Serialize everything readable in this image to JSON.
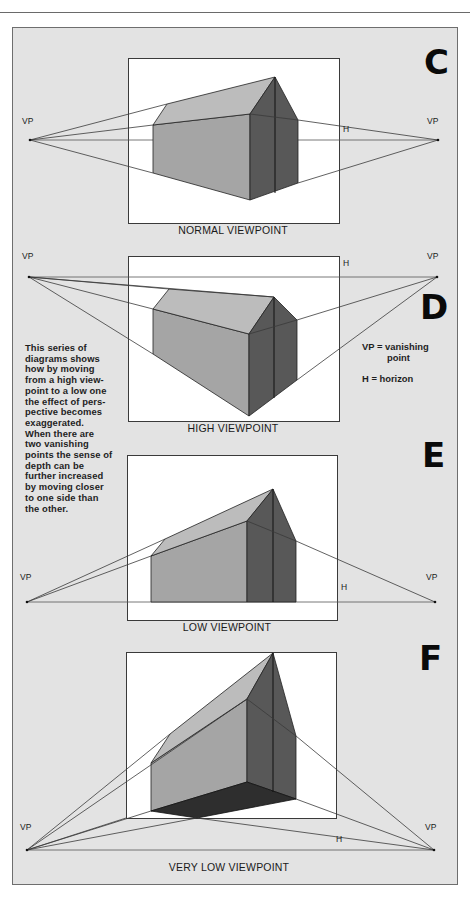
{
  "colors": {
    "panel_bg": "#e3e3e3",
    "panel_border": "#6e6e6e",
    "box_bg": "#ffffff",
    "roof": "#bcbcbc",
    "side_wall": "#a5a5a5",
    "gable": "#585858",
    "gable_right": "#666666",
    "underside": "#2e2e2e",
    "line": "#3a3a3a"
  },
  "description": {
    "lines": [
      "This series of",
      "diagrams shows",
      "how by moving",
      "from a high view-",
      "point to a low one",
      "the effect of pers-",
      "pective becomes",
      "exaggerated.",
      "When there are",
      "two vanishing",
      "points the sense of",
      "depth can be",
      "further increased",
      "by moving closer",
      "to one side than",
      "the other."
    ]
  },
  "legend": {
    "vp_line1": "VP = vanishing",
    "vp_line2": "point",
    "h_line": "H = horizon"
  },
  "diagrams": [
    {
      "letter": "C",
      "caption": "NORMAL VIEWPOINT",
      "vp_label": "VP",
      "h_label": "H",
      "box": [
        128,
        58,
        211,
        165
      ],
      "letter_pos": [
        424,
        74
      ],
      "caption_pos": [
        233,
        234
      ],
      "vp_left": [
        30,
        140
      ],
      "vp_right": [
        438,
        140
      ],
      "vp_left_label": [
        22,
        124
      ],
      "vp_right_label": [
        427,
        124
      ],
      "h_pos": [
        343,
        132
      ],
      "horizon": [
        30,
        140,
        438,
        140
      ],
      "roof": [
        [
          167,
          104
        ],
        [
          275,
          77
        ],
        [
          250,
          114
        ],
        [
          153,
          125
        ]
      ],
      "side": [
        [
          153,
          125
        ],
        [
          250,
          114
        ],
        [
          250,
          200
        ],
        [
          153,
          173
        ]
      ],
      "gable": [
        [
          250,
          114
        ],
        [
          275,
          77
        ],
        [
          298,
          120
        ],
        [
          298,
          183
        ],
        [
          250,
          200
        ]
      ],
      "underside": null,
      "center": [
        275,
        77,
        275,
        193
      ],
      "rays": [
        [
          30,
          140,
          167,
          104
        ],
        [
          30,
          140,
          153,
          125
        ],
        [
          30,
          140,
          153,
          173
        ],
        [
          438,
          140,
          298,
          120
        ],
        [
          438,
          140,
          298,
          183
        ],
        [
          250,
          114,
          298,
          120
        ]
      ]
    },
    {
      "letter": "D",
      "caption": "HIGH VIEWPOINT",
      "vp_label": "VP",
      "h_label": "H",
      "box": [
        128,
        256,
        211,
        165
      ],
      "letter_pos": [
        420,
        319
      ],
      "caption_pos": [
        233,
        432
      ],
      "vp_left": [
        29,
        277
      ],
      "vp_right": [
        437,
        277
      ],
      "vp_left_label": [
        22,
        259
      ],
      "vp_right_label": [
        427,
        259
      ],
      "h_pos": [
        343,
        266
      ],
      "horizon": [
        29,
        277,
        437,
        277
      ],
      "roof": [
        [
          169,
          289
        ],
        [
          274,
          297
        ],
        [
          249,
          334
        ],
        [
          153,
          309
        ]
      ],
      "side": [
        [
          153,
          309
        ],
        [
          249,
          334
        ],
        [
          249,
          416
        ],
        [
          153,
          354
        ]
      ],
      "gable": [
        [
          249,
          334
        ],
        [
          274,
          297
        ],
        [
          297,
          320
        ],
        [
          297,
          380
        ],
        [
          249,
          416
        ]
      ],
      "underside": null,
      "center": [
        274,
        297,
        274,
        398
      ],
      "rays": [
        [
          29,
          277,
          169,
          289
        ],
        [
          29,
          277,
          153,
          309
        ],
        [
          29,
          277,
          153,
          354
        ],
        [
          437,
          277,
          297,
          320
        ],
        [
          437,
          277,
          297,
          380
        ],
        [
          249,
          334,
          297,
          320
        ],
        [
          29,
          277,
          274,
          297
        ]
      ]
    },
    {
      "letter": "E",
      "caption": "LOW VIEWPOINT",
      "vp_label": "VP",
      "h_label": "H",
      "box": [
        127,
        455,
        210,
        165
      ],
      "letter_pos": [
        422,
        467
      ],
      "caption_pos": [
        227,
        631
      ],
      "vp_left": [
        27,
        602
      ],
      "vp_right": [
        435,
        602
      ],
      "vp_left_label": [
        20,
        580
      ],
      "vp_right_label": [
        426,
        580
      ],
      "h_pos": [
        341,
        590
      ],
      "horizon": [
        27,
        602,
        435,
        602
      ],
      "roof": [
        [
          165,
          539
        ],
        [
          273,
          489
        ],
        [
          247,
          521
        ],
        [
          151,
          556
        ]
      ],
      "side": [
        [
          151,
          556
        ],
        [
          247,
          521
        ],
        [
          247,
          602
        ],
        [
          151,
          602
        ]
      ],
      "gable": [
        [
          247,
          521
        ],
        [
          273,
          489
        ],
        [
          296,
          541
        ],
        [
          296,
          602
        ],
        [
          247,
          602
        ]
      ],
      "underside": null,
      "center": [
        273,
        489,
        273,
        602
      ],
      "rays": [
        [
          27,
          602,
          165,
          539
        ],
        [
          27,
          602,
          151,
          556
        ],
        [
          435,
          602,
          296,
          541
        ],
        [
          247,
          521,
          296,
          541
        ]
      ]
    },
    {
      "letter": "F",
      "caption": "VERY LOW VIEWPOINT",
      "vp_label": "VP",
      "h_label": "H",
      "box": [
        126,
        652,
        210,
        166
      ],
      "letter_pos": [
        419,
        670
      ],
      "caption_pos": [
        229,
        871
      ],
      "vp_left": [
        27,
        850
      ],
      "vp_right": [
        434,
        850
      ],
      "vp_left_label": [
        20,
        830
      ],
      "vp_right_label": [
        425,
        830
      ],
      "h_pos": [
        336,
        842
      ],
      "horizon": [
        27,
        850,
        434,
        850
      ],
      "roof": [
        [
          170,
          734
        ],
        [
          273,
          653
        ],
        [
          247,
          699
        ],
        [
          151,
          763
        ]
      ],
      "side": [
        [
          151,
          763
        ],
        [
          247,
          699
        ],
        [
          247,
          782
        ],
        [
          151,
          811
        ]
      ],
      "gable": [
        [
          247,
          699
        ],
        [
          273,
          653
        ],
        [
          296,
          736
        ],
        [
          296,
          799
        ],
        [
          247,
          782
        ]
      ],
      "underside": [
        [
          151,
          811
        ],
        [
          247,
          782
        ],
        [
          296,
          799
        ],
        [
          197,
          818
        ]
      ],
      "center": [
        273,
        653,
        273,
        792
      ],
      "rays": [
        [
          27,
          850,
          170,
          734
        ],
        [
          27,
          850,
          247,
          699
        ],
        [
          27,
          850,
          151,
          811
        ],
        [
          27,
          850,
          197,
          818
        ],
        [
          27,
          850,
          126,
          818
        ],
        [
          434,
          850,
          296,
          736
        ],
        [
          434,
          850,
          296,
          799
        ],
        [
          434,
          850,
          197,
          818
        ],
        [
          247,
          699,
          296,
          736
        ]
      ]
    }
  ]
}
